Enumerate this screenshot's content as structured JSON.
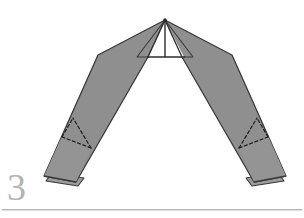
{
  "figure": {
    "step_label": "3",
    "colors": {
      "paper_fill": "#8f8f8f",
      "paper_fill_light": "#999999",
      "paper_fill_dark": "#868686",
      "outline": "#3a3a3a",
      "fold_dashed": "#1f1f1f",
      "background": "#ffffff",
      "step_number": "#b4b4b4",
      "rule": "#b8b8b8"
    },
    "geometry": {
      "apex": [
        165,
        20
      ],
      "left_shoulder": [
        98,
        55
      ],
      "right_shoulder": [
        232,
        55
      ],
      "center_baseline_y": 57,
      "center_baseline_x1": 148,
      "center_baseline_x2": 184,
      "left_tip": [
        44,
        178
      ],
      "right_tip": [
        286,
        178
      ]
    },
    "parts": [
      {
        "name": "left-arm",
        "label": "Left folded arm"
      },
      {
        "name": "right-arm",
        "label": "Right folded arm"
      },
      {
        "name": "center-peak",
        "label": "Center peak flap"
      },
      {
        "name": "left-fold-lines",
        "label": "Left dashed fold lines"
      },
      {
        "name": "right-fold-lines",
        "label": "Right dashed fold lines"
      }
    ]
  },
  "rule": {
    "visible": true
  }
}
